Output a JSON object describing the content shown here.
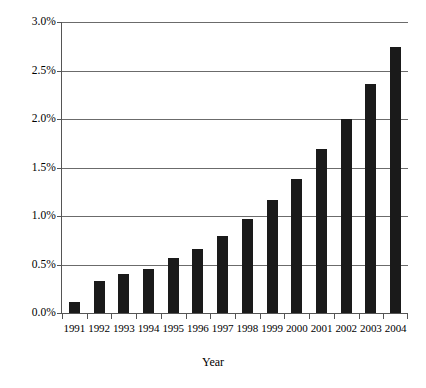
{
  "chart_data": {
    "type": "bar",
    "title": "",
    "subtitle": "",
    "xlabel": "Year",
    "ylabel": "",
    "categories": [
      "1991",
      "1992",
      "1993",
      "1994",
      "1995",
      "1996",
      "1997",
      "1998",
      "1999",
      "2000",
      "2001",
      "2002",
      "2003",
      "2004"
    ],
    "values": [
      0.11,
      0.33,
      0.4,
      0.45,
      0.57,
      0.66,
      0.79,
      0.97,
      1.17,
      1.38,
      1.69,
      2.0,
      2.36,
      2.74
    ],
    "value_unit": "%",
    "ylim": [
      0.0,
      3.0
    ],
    "ytick_values": [
      0.0,
      0.5,
      1.0,
      1.5,
      2.0,
      2.5,
      3.0
    ],
    "ytick_labels": [
      "0.0%",
      "0.5%",
      "1.0%",
      "1.5%",
      "2.0%",
      "2.5%",
      "3.0%"
    ],
    "grid": true,
    "legend": false,
    "legend_position": "none",
    "bar_color": "#1a1a1a",
    "grid_color": "#6b6b6b",
    "axis_color": "#555555",
    "background_color": "#ffffff"
  }
}
